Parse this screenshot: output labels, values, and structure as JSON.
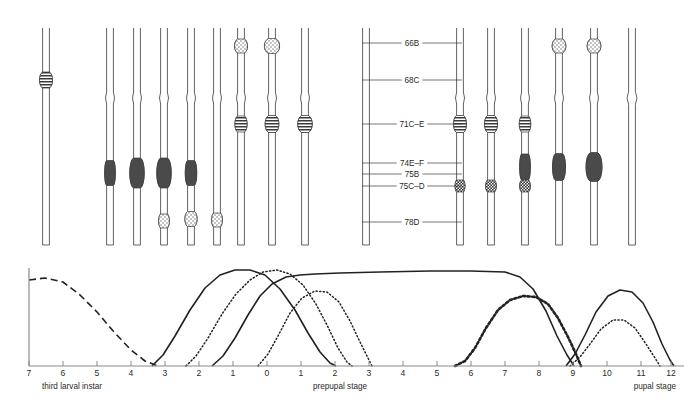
{
  "figure": {
    "caption": "",
    "background": "#ffffff",
    "ink": "#3a3a3a",
    "puff_fill": "#4a4a4a"
  },
  "chromosome_panel": {
    "region_labels": [
      {
        "name": "66B",
        "text": "66B",
        "y": 43
      },
      {
        "name": "68C",
        "text": "68C",
        "y": 80
      },
      {
        "name": "71C-E",
        "text": "71C–E",
        "y": 124
      },
      {
        "name": "74E-F",
        "text": "74E–F",
        "y": 163
      },
      {
        "name": "75B",
        "text": "75B",
        "y": 174
      },
      {
        "name": "75C-D",
        "text": "75C–D",
        "y": 186
      },
      {
        "name": "78D",
        "text": "78D",
        "y": 222
      }
    ],
    "label_leader_left_x": 362,
    "label_leader_right_x": 462,
    "columns": [
      {
        "x": 46,
        "top": 28,
        "bottom": 245,
        "features": [
          {
            "type": "banded",
            "y": 80,
            "w": 15,
            "h": 13
          }
        ]
      },
      {
        "x": 110,
        "top": 28,
        "bottom": 245,
        "features": [
          {
            "type": "notch",
            "y": 98,
            "w": 9,
            "h": 12
          },
          {
            "type": "solid",
            "y": 173,
            "w": 12,
            "h": 22
          }
        ]
      },
      {
        "x": 137,
        "top": 28,
        "bottom": 245,
        "features": [
          {
            "type": "notch",
            "y": 98,
            "w": 9,
            "h": 12
          },
          {
            "type": "solid",
            "y": 173,
            "w": 17,
            "h": 27
          }
        ]
      },
      {
        "x": 164,
        "top": 28,
        "bottom": 245,
        "features": [
          {
            "type": "notch",
            "y": 98,
            "w": 9,
            "h": 12
          },
          {
            "type": "solid",
            "y": 173,
            "w": 17,
            "h": 27
          },
          {
            "type": "stipple",
            "y": 221,
            "w": 12,
            "h": 11
          }
        ]
      },
      {
        "x": 191,
        "top": 28,
        "bottom": 245,
        "features": [
          {
            "type": "notch",
            "y": 98,
            "w": 9,
            "h": 12
          },
          {
            "type": "solid",
            "y": 173,
            "w": 13,
            "h": 22
          },
          {
            "type": "stipple",
            "y": 219,
            "w": 14,
            "h": 12
          }
        ]
      },
      {
        "x": 217,
        "top": 28,
        "bottom": 245,
        "features": [
          {
            "type": "notch",
            "y": 98,
            "w": 9,
            "h": 12
          },
          {
            "type": "stipple",
            "y": 220,
            "w": 12,
            "h": 11
          }
        ]
      },
      {
        "x": 241,
        "top": 28,
        "bottom": 245,
        "features": [
          {
            "type": "notch",
            "y": 98,
            "w": 9,
            "h": 12
          },
          {
            "type": "stipple",
            "y": 46,
            "w": 15,
            "h": 11
          },
          {
            "type": "banded",
            "y": 124,
            "w": 14,
            "h": 13
          }
        ]
      },
      {
        "x": 272,
        "top": 28,
        "bottom": 245,
        "features": [
          {
            "type": "notch",
            "y": 98,
            "w": 9,
            "h": 12
          },
          {
            "type": "stipple",
            "y": 46,
            "w": 18,
            "h": 12
          },
          {
            "type": "banded",
            "y": 124,
            "w": 16,
            "h": 14
          }
        ]
      },
      {
        "x": 305,
        "top": 28,
        "bottom": 245,
        "features": [
          {
            "type": "notch",
            "y": 98,
            "w": 9,
            "h": 12
          },
          {
            "type": "banded",
            "y": 124,
            "w": 17,
            "h": 14
          }
        ]
      },
      {
        "x": 366,
        "top": 28,
        "bottom": 245,
        "features": []
      },
      {
        "x": 460,
        "top": 28,
        "bottom": 245,
        "features": [
          {
            "type": "notch",
            "y": 98,
            "w": 9,
            "h": 12
          },
          {
            "type": "banded",
            "y": 124,
            "w": 15,
            "h": 14
          },
          {
            "type": "stipple-dark",
            "y": 186,
            "w": 11,
            "h": 9
          }
        ]
      },
      {
        "x": 491,
        "top": 28,
        "bottom": 245,
        "features": [
          {
            "type": "notch",
            "y": 98,
            "w": 9,
            "h": 12
          },
          {
            "type": "banded",
            "y": 124,
            "w": 15,
            "h": 14
          },
          {
            "type": "stipple-dark",
            "y": 186,
            "w": 12,
            "h": 9
          }
        ]
      },
      {
        "x": 525,
        "top": 28,
        "bottom": 245,
        "features": [
          {
            "type": "notch",
            "y": 98,
            "w": 9,
            "h": 12
          },
          {
            "type": "banded",
            "y": 124,
            "w": 13,
            "h": 13
          },
          {
            "type": "solid",
            "y": 167,
            "w": 12,
            "h": 23
          },
          {
            "type": "stipple-dark",
            "y": 186,
            "w": 12,
            "h": 9
          }
        ]
      },
      {
        "x": 559,
        "top": 28,
        "bottom": 245,
        "features": [
          {
            "type": "notch",
            "y": 98,
            "w": 9,
            "h": 12
          },
          {
            "type": "stipple",
            "y": 46,
            "w": 16,
            "h": 11
          },
          {
            "type": "solid",
            "y": 167,
            "w": 15,
            "h": 24
          }
        ]
      },
      {
        "x": 594,
        "top": 28,
        "bottom": 245,
        "features": [
          {
            "type": "notch",
            "y": 98,
            "w": 9,
            "h": 12
          },
          {
            "type": "stipple",
            "y": 46,
            "w": 16,
            "h": 11
          },
          {
            "type": "solid",
            "y": 167,
            "w": 19,
            "h": 26
          }
        ]
      },
      {
        "x": 632,
        "top": 28,
        "bottom": 245,
        "features": [
          {
            "type": "notch",
            "y": 98,
            "w": 10,
            "h": 13
          }
        ]
      }
    ]
  },
  "chart_data": {
    "type": "line",
    "title": "",
    "xlabel": "",
    "ylabel": "",
    "grid": false,
    "legend": "none",
    "ylim": [
      0,
      100
    ],
    "xticks": [
      {
        "label": "7",
        "x": 29
      },
      {
        "label": "6",
        "x": 63
      },
      {
        "label": "5",
        "x": 97
      },
      {
        "label": "4",
        "x": 131
      },
      {
        "label": "3",
        "x": 165
      },
      {
        "label": "2",
        "x": 199
      },
      {
        "label": "1",
        "x": 233
      },
      {
        "label": "0",
        "x": 267
      },
      {
        "label": "1",
        "x": 301
      },
      {
        "label": "2",
        "x": 335
      },
      {
        "label": "3",
        "x": 369
      },
      {
        "label": "4",
        "x": 403
      },
      {
        "label": "5",
        "x": 437
      },
      {
        "label": "6",
        "x": 471
      },
      {
        "label": "7",
        "x": 505
      },
      {
        "label": "8",
        "x": 539
      },
      {
        "label": "9",
        "x": 573
      },
      {
        "label": "10",
        "x": 607
      },
      {
        "label": "11",
        "x": 641
      },
      {
        "label": "12",
        "x": 671
      }
    ],
    "stage_labels": [
      {
        "name": "third-larval-instar",
        "text": "third larval instar",
        "x": 42,
        "anchor": "start"
      },
      {
        "name": "prepupal-stage",
        "text": "prepupal stage",
        "x": 340,
        "anchor": "middle"
      },
      {
        "name": "pupal-stage",
        "text": "pupal stage",
        "x": 676,
        "anchor": "end"
      }
    ],
    "axis": {
      "x0": 29,
      "x1": 684,
      "y_baseline": 366,
      "y_top": 268
    },
    "series": [
      {
        "name": "intermolt-puff-decay",
        "style": "dashed",
        "points": [
          [
            29,
            280
          ],
          [
            45,
            278
          ],
          [
            63,
            282
          ],
          [
            80,
            295
          ],
          [
            97,
            312
          ],
          [
            114,
            332
          ],
          [
            131,
            350
          ],
          [
            145,
            361
          ],
          [
            158,
            366
          ]
        ]
      },
      {
        "name": "early-puff-I",
        "style": "solid",
        "points": [
          [
            152,
            366
          ],
          [
            163,
            355
          ],
          [
            175,
            336
          ],
          [
            190,
            310
          ],
          [
            205,
            288
          ],
          [
            220,
            275
          ],
          [
            235,
            270
          ],
          [
            250,
            270
          ],
          [
            265,
            275
          ],
          [
            280,
            289
          ],
          [
            295,
            310
          ],
          [
            308,
            333
          ],
          [
            320,
            352
          ],
          [
            330,
            363
          ],
          [
            336,
            366
          ]
        ]
      },
      {
        "name": "early-puff-II",
        "style": "dotted-fine",
        "points": [
          [
            186,
            366
          ],
          [
            196,
            356
          ],
          [
            208,
            338
          ],
          [
            222,
            314
          ],
          [
            236,
            294
          ],
          [
            250,
            280
          ],
          [
            263,
            272
          ],
          [
            277,
            270
          ],
          [
            290,
            274
          ],
          [
            303,
            285
          ],
          [
            316,
            304
          ],
          [
            328,
            327
          ],
          [
            338,
            348
          ],
          [
            347,
            362
          ],
          [
            352,
            366
          ]
        ]
      },
      {
        "name": "intermolt-puff-rise",
        "style": "solid",
        "points": [
          [
            212,
            366
          ],
          [
            223,
            356
          ],
          [
            235,
            338
          ],
          [
            248,
            315
          ],
          [
            260,
            296
          ],
          [
            272,
            284
          ],
          [
            286,
            277
          ],
          [
            300,
            275
          ],
          [
            315,
            274
          ],
          [
            340,
            273
          ],
          [
            380,
            272
          ],
          [
            430,
            271
          ],
          [
            470,
            271
          ],
          [
            505,
            272
          ],
          [
            520,
            277
          ],
          [
            533,
            289
          ],
          [
            546,
            311
          ],
          [
            557,
            336
          ],
          [
            567,
            355
          ],
          [
            574,
            366
          ]
        ]
      },
      {
        "name": "late-puff-I",
        "style": "dotted-fine",
        "points": [
          [
            258,
            366
          ],
          [
            268,
            354
          ],
          [
            278,
            336
          ],
          [
            290,
            313
          ],
          [
            302,
            298
          ],
          [
            315,
            291
          ],
          [
            327,
            292
          ],
          [
            339,
            302
          ],
          [
            350,
            321
          ],
          [
            360,
            342
          ],
          [
            368,
            358
          ],
          [
            372,
            366
          ]
        ]
      },
      {
        "name": "late-puff-II",
        "style": "dotted-thick",
        "points": [
          [
            455,
            366
          ],
          [
            465,
            361
          ],
          [
            475,
            348
          ],
          [
            486,
            328
          ],
          [
            498,
            310
          ],
          [
            510,
            300
          ],
          [
            523,
            296
          ],
          [
            536,
            297
          ],
          [
            548,
            304
          ],
          [
            558,
            318
          ],
          [
            568,
            337
          ],
          [
            576,
            354
          ],
          [
            581,
            366
          ]
        ]
      },
      {
        "name": "pupal-puff-I",
        "style": "solid",
        "points": [
          [
            566,
            366
          ],
          [
            575,
            354
          ],
          [
            585,
            335
          ],
          [
            596,
            312
          ],
          [
            608,
            296
          ],
          [
            620,
            290
          ],
          [
            632,
            292
          ],
          [
            643,
            303
          ],
          [
            653,
            322
          ],
          [
            662,
            344
          ],
          [
            670,
            360
          ],
          [
            674,
            366
          ]
        ]
      },
      {
        "name": "pupal-puff-II",
        "style": "dotted-fine",
        "points": [
          [
            570,
            366
          ],
          [
            580,
            357
          ],
          [
            590,
            344
          ],
          [
            601,
            329
          ],
          [
            613,
            320
          ],
          [
            624,
            320
          ],
          [
            635,
            328
          ],
          [
            646,
            344
          ],
          [
            655,
            358
          ],
          [
            660,
            366
          ]
        ]
      }
    ]
  }
}
